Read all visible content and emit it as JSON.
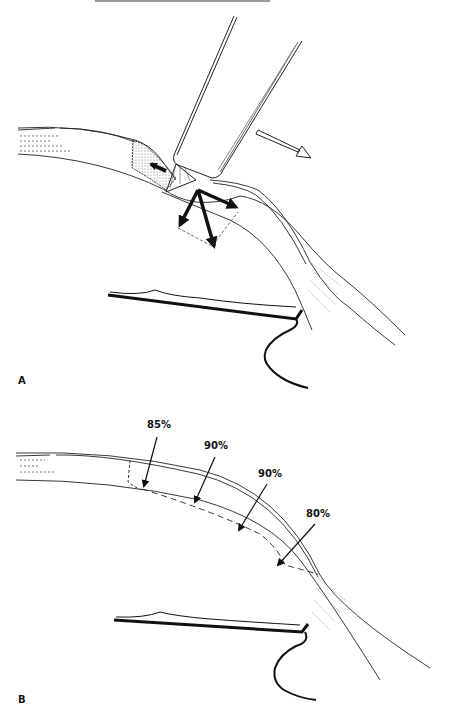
{
  "figure": {
    "header_text_cropped": "",
    "panels": [
      {
        "id": "A",
        "label": "A",
        "description": "Blade pressing on corneal/scleral tissue with force vector arrows"
      },
      {
        "id": "B",
        "label": "B",
        "description": "Incision depth along the curve",
        "annotations": [
          {
            "label": "85%"
          },
          {
            "label": "90%"
          },
          {
            "label": "90%"
          },
          {
            "label": "80%"
          }
        ]
      }
    ]
  }
}
